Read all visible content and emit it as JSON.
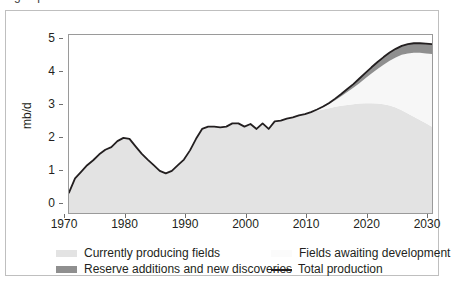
{
  "figure": {
    "cut_title_fragment": "g    ...    p",
    "frame_color": "#bfbfbf",
    "plot_border_color": "#9a9a9a"
  },
  "chart_data": {
    "type": "area",
    "title": "",
    "xlabel": "",
    "ylabel": "mb/d",
    "xlim": [
      1970,
      2030
    ],
    "ylim": [
      0,
      5.4
    ],
    "grid": false,
    "legend_position": "below",
    "xticks": [
      1970,
      1980,
      1990,
      2000,
      2010,
      2020,
      2030
    ],
    "yticks": [
      0,
      1,
      2,
      3,
      4,
      5
    ],
    "stacked": true,
    "colors": {
      "currently_producing_fields": "#e3e3e3",
      "fields_awaiting_development": "#f7f7f7",
      "reserve_additions_and_new_discoveries": "#8f8f8f",
      "total_production_line": "#231f20"
    },
    "x": [
      1970,
      1971,
      1972,
      1973,
      1974,
      1975,
      1976,
      1977,
      1978,
      1979,
      1980,
      1981,
      1982,
      1983,
      1984,
      1985,
      1986,
      1987,
      1988,
      1989,
      1990,
      1991,
      1992,
      1993,
      1994,
      1995,
      1996,
      1997,
      1998,
      1999,
      2000,
      2001,
      2002,
      2003,
      2004,
      2005,
      2006,
      2007,
      2008,
      2009,
      2010,
      2011,
      2012,
      2013,
      2014,
      2015,
      2016,
      2017,
      2018,
      2019,
      2020,
      2021,
      2022,
      2023,
      2024,
      2025,
      2026,
      2027,
      2028,
      2029,
      2030
    ],
    "series": [
      {
        "name": "Currently producing fields",
        "color": "#e3e3e3",
        "values": [
          0.62,
          1.05,
          1.25,
          1.45,
          1.6,
          1.78,
          1.92,
          2.0,
          2.18,
          2.28,
          2.25,
          2.02,
          1.8,
          1.62,
          1.45,
          1.28,
          1.2,
          1.28,
          1.45,
          1.62,
          1.9,
          2.25,
          2.55,
          2.62,
          2.62,
          2.6,
          2.62,
          2.72,
          2.72,
          2.62,
          2.7,
          2.55,
          2.72,
          2.55,
          2.78,
          2.8,
          2.86,
          2.9,
          2.96,
          3.0,
          3.06,
          3.1,
          3.14,
          3.18,
          3.22,
          3.25,
          3.28,
          3.3,
          3.32,
          3.33,
          3.33,
          3.32,
          3.3,
          3.26,
          3.2,
          3.12,
          3.02,
          2.92,
          2.82,
          2.72,
          2.62
        ]
      },
      {
        "name": "Fields awaiting development",
        "color": "#f7f7f7",
        "values": [
          0,
          0,
          0,
          0,
          0,
          0,
          0,
          0,
          0,
          0,
          0,
          0,
          0,
          0,
          0,
          0,
          0,
          0,
          0,
          0,
          0,
          0,
          0,
          0,
          0,
          0,
          0,
          0,
          0,
          0,
          0,
          0,
          0,
          0,
          0,
          0,
          0,
          0,
          0,
          0,
          0.0,
          0.03,
          0.07,
          0.13,
          0.2,
          0.29,
          0.39,
          0.5,
          0.62,
          0.76,
          0.9,
          1.05,
          1.2,
          1.36,
          1.52,
          1.68,
          1.82,
          1.94,
          2.04,
          2.12,
          2.2
        ]
      },
      {
        "name": "Reserve additions and new discoveries",
        "color": "#8f8f8f",
        "values": [
          0,
          0,
          0,
          0,
          0,
          0,
          0,
          0,
          0,
          0,
          0,
          0,
          0,
          0,
          0,
          0,
          0,
          0,
          0,
          0,
          0,
          0,
          0,
          0,
          0,
          0,
          0,
          0,
          0,
          0,
          0.0,
          0.0,
          0.0,
          0.0,
          0.0,
          0.0,
          0.0,
          0.0,
          0.0,
          0.0,
          0.0,
          0.01,
          0.02,
          0.03,
          0.05,
          0.07,
          0.09,
          0.11,
          0.14,
          0.16,
          0.19,
          0.21,
          0.23,
          0.25,
          0.26,
          0.27,
          0.28,
          0.29,
          0.29,
          0.3,
          0.3
        ]
      }
    ],
    "total_production": {
      "name": "Total production",
      "color": "#231f20",
      "values": [
        0.62,
        1.05,
        1.25,
        1.45,
        1.6,
        1.78,
        1.92,
        2.0,
        2.18,
        2.28,
        2.25,
        2.02,
        1.8,
        1.62,
        1.45,
        1.28,
        1.2,
        1.28,
        1.45,
        1.62,
        1.9,
        2.25,
        2.55,
        2.62,
        2.62,
        2.6,
        2.62,
        2.72,
        2.72,
        2.62,
        2.7,
        2.55,
        2.72,
        2.55,
        2.78,
        2.8,
        2.86,
        2.9,
        2.96,
        3.0,
        3.06,
        3.14,
        3.23,
        3.34,
        3.47,
        3.61,
        3.76,
        3.91,
        4.08,
        4.25,
        4.42,
        4.58,
        4.73,
        4.87,
        4.98,
        5.07,
        5.12,
        5.15,
        5.15,
        5.14,
        5.12
      ]
    }
  },
  "axis": {
    "y_title": "mb/d",
    "y_ticks": [
      "0",
      "1",
      "2",
      "3",
      "4",
      "5"
    ],
    "x_ticks": [
      "1970",
      "1980",
      "1990",
      "2000",
      "2010",
      "2020",
      "2030"
    ]
  },
  "legend": {
    "items": [
      {
        "label": "Currently producing fields",
        "swatch": "#e3e3e3",
        "type": "box",
        "row": 0,
        "col": 0
      },
      {
        "label": "Fields awaiting development",
        "swatch": "#fbfbfb",
        "type": "box",
        "row": 0,
        "col": 1
      },
      {
        "label": "Reserve additions and new discoveries",
        "swatch": "#8f8f8f",
        "type": "box",
        "row": 1,
        "col": 0
      },
      {
        "label": "Total production",
        "swatch": "#231f20",
        "type": "line",
        "row": 1,
        "col": 1
      }
    ]
  }
}
